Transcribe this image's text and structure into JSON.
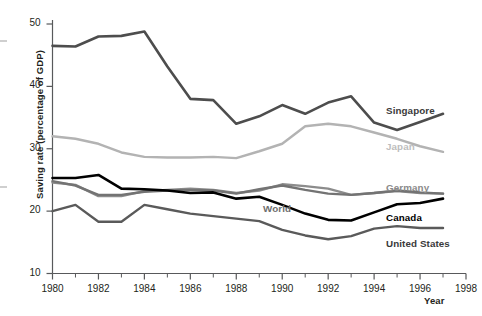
{
  "chart_data": {
    "type": "line",
    "title": "",
    "xlabel": "Year",
    "ylabel": "Saving rate (percentage of GDP)",
    "xlim": [
      1980,
      1998
    ],
    "ylim": [
      10,
      50
    ],
    "grid": false,
    "legend_position": "right-inline-labels",
    "x": [
      1980,
      1981,
      1982,
      1983,
      1984,
      1985,
      1986,
      1987,
      1988,
      1989,
      1990,
      1991,
      1992,
      1993,
      1994,
      1995,
      1996,
      1997
    ],
    "yticks": [
      10,
      20,
      30,
      40,
      50
    ],
    "xticks": [
      1980,
      1982,
      1984,
      1986,
      1988,
      1990,
      1992,
      1994,
      1996,
      1998
    ],
    "xticks_minor": [
      1981,
      1983,
      1985,
      1987,
      1989,
      1991,
      1993,
      1995,
      1997
    ],
    "series": [
      {
        "name": "Singapore",
        "color": "#4d4d4d",
        "label_color": "#3a3a3a",
        "width": 2.6,
        "values": [
          46.5,
          46.4,
          48.0,
          48.1,
          48.8,
          43.2,
          38.0,
          37.8,
          34.0,
          35.2,
          37.0,
          35.6,
          37.4,
          38.4,
          34.2,
          33.0,
          34.3,
          35.6
        ]
      },
      {
        "name": "Japan",
        "color": "#b3b3b3",
        "label_color": "#bdbdbd",
        "width": 2.4,
        "values": [
          32.0,
          31.6,
          30.8,
          29.4,
          28.7,
          28.6,
          28.6,
          28.7,
          28.5,
          29.6,
          30.8,
          33.6,
          34.0,
          33.6,
          32.6,
          31.6,
          30.4,
          29.5
        ]
      },
      {
        "name": "Germany",
        "color": "#8c8c8c",
        "label_color": "#8a8a8a",
        "width": 2.4,
        "values": [
          24.6,
          24.2,
          22.4,
          22.4,
          23.2,
          23.4,
          23.6,
          23.4,
          22.9,
          23.3,
          24.3,
          24.0,
          23.6,
          22.6,
          22.9,
          23.2,
          22.9,
          22.8
        ]
      },
      {
        "name": "World",
        "color": "#737373",
        "label_color": "#6e6e6e",
        "width": 2.4,
        "values": [
          24.8,
          24.1,
          22.6,
          22.6,
          23.1,
          23.3,
          23.4,
          23.3,
          22.8,
          23.5,
          24.1,
          23.4,
          22.8,
          22.6,
          22.9,
          23.3,
          23.0,
          22.8
        ]
      },
      {
        "name": "Canada",
        "color": "#000000",
        "label_color": "#000000",
        "width": 2.6,
        "values": [
          25.3,
          25.3,
          25.8,
          23.6,
          23.5,
          23.3,
          22.9,
          23.0,
          22.0,
          22.3,
          21.0,
          19.6,
          18.6,
          18.5,
          19.8,
          21.1,
          21.3,
          22.0
        ]
      },
      {
        "name": "United States",
        "color": "#5a5a5a",
        "label_color": "#3a3a3a",
        "width": 2.4,
        "values": [
          20.0,
          21.0,
          18.3,
          18.3,
          21.0,
          20.3,
          19.6,
          19.2,
          18.8,
          18.4,
          17.0,
          16.1,
          15.5,
          16.0,
          17.2,
          17.6,
          17.3,
          17.3
        ]
      }
    ],
    "series_labels": [
      {
        "name": "Singapore",
        "x": 386,
        "y": 105
      },
      {
        "name": "Japan",
        "x": 386,
        "y": 141
      },
      {
        "name": "Germany",
        "x": 386,
        "y": 182
      },
      {
        "name": "World",
        "x": 263,
        "y": 203
      },
      {
        "name": "Canada",
        "x": 386,
        "y": 212
      },
      {
        "name": "United States",
        "x": 386,
        "y": 238
      }
    ]
  }
}
